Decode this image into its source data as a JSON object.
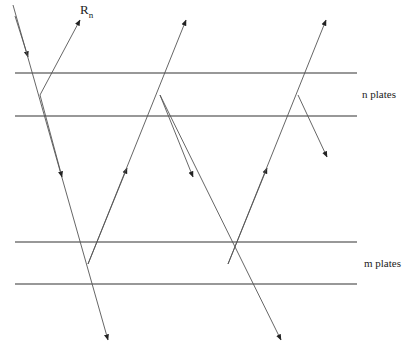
{
  "diagram": {
    "labels": {
      "ray_label": "R",
      "ray_label_sub": "n",
      "n_group": "n plates",
      "m_group": "m plates"
    },
    "plates": {
      "n": [
        73,
        116
      ],
      "m": [
        242,
        284
      ]
    },
    "colors": {
      "line": "#333333",
      "ray": "#555555",
      "background": "#ffffff"
    }
  }
}
